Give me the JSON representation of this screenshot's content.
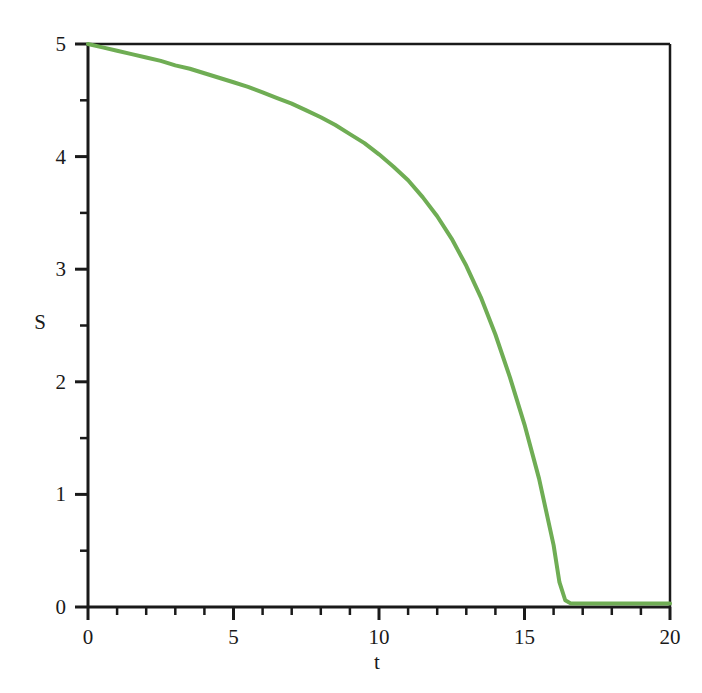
{
  "chart_data": {
    "type": "line",
    "title": "",
    "subtitle": "",
    "xlabel": "t",
    "ylabel": "S",
    "xlim": [
      0,
      20
    ],
    "ylim": [
      0,
      5
    ],
    "grid": false,
    "legend": null,
    "legend_position": "none",
    "x_ticks": [
      0,
      5,
      10,
      15,
      20
    ],
    "x_tick_labels": [
      "0",
      "5",
      "10",
      "15",
      "20"
    ],
    "x_minor_tick_step": 1,
    "y_ticks": [
      0,
      1,
      2,
      3,
      4,
      5
    ],
    "y_tick_labels": [
      "0",
      "1",
      "2",
      "3",
      "4",
      "5"
    ],
    "y_minor_tick_step": 0.5,
    "series": [
      {
        "name": "S",
        "color": "#6FAD54",
        "line_width": 4,
        "x": [
          0.0,
          0.5,
          1.0,
          1.5,
          2.0,
          2.5,
          3.0,
          3.5,
          4.0,
          4.5,
          5.0,
          5.5,
          6.0,
          6.5,
          7.0,
          7.5,
          8.0,
          8.5,
          9.0,
          9.5,
          10.0,
          10.5,
          11.0,
          11.5,
          12.0,
          12.5,
          13.0,
          13.5,
          14.0,
          14.5,
          15.0,
          15.5,
          16.0,
          16.2,
          16.4,
          16.6,
          17.0,
          17.5,
          18.0,
          18.5,
          19.0,
          19.5,
          20.0
        ],
        "y": [
          5.0,
          4.97,
          4.94,
          4.91,
          4.88,
          4.85,
          4.81,
          4.78,
          4.74,
          4.7,
          4.66,
          4.62,
          4.57,
          4.52,
          4.47,
          4.41,
          4.35,
          4.28,
          4.2,
          4.12,
          4.02,
          3.91,
          3.79,
          3.64,
          3.47,
          3.27,
          3.03,
          2.75,
          2.42,
          2.04,
          1.62,
          1.14,
          0.55,
          0.22,
          0.06,
          0.03,
          0.03,
          0.03,
          0.03,
          0.03,
          0.03,
          0.03,
          0.03
        ]
      }
    ],
    "annotations": []
  },
  "axes": {
    "frame_color": "#1a1a1a",
    "background": "#ffffff"
  }
}
